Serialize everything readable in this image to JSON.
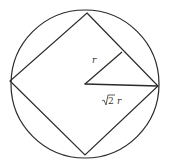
{
  "diagram": {
    "colors": {
      "stroke": "#2a2a2a",
      "background": "#ffffff",
      "label": "#333333"
    },
    "circle": {
      "cx": 85,
      "cy": 84,
      "r": 74
    },
    "square_vertices": {
      "top": [
        87,
        13
      ],
      "right": [
        158,
        86
      ],
      "bottom": [
        85,
        155
      ],
      "left": [
        10,
        81
      ]
    },
    "center": [
      85,
      84
    ],
    "perpendicular_foot": [
      122,
      52
    ],
    "labels": {
      "apothem": "r",
      "radius_sqrt": "√2",
      "radius_var": "r"
    }
  }
}
